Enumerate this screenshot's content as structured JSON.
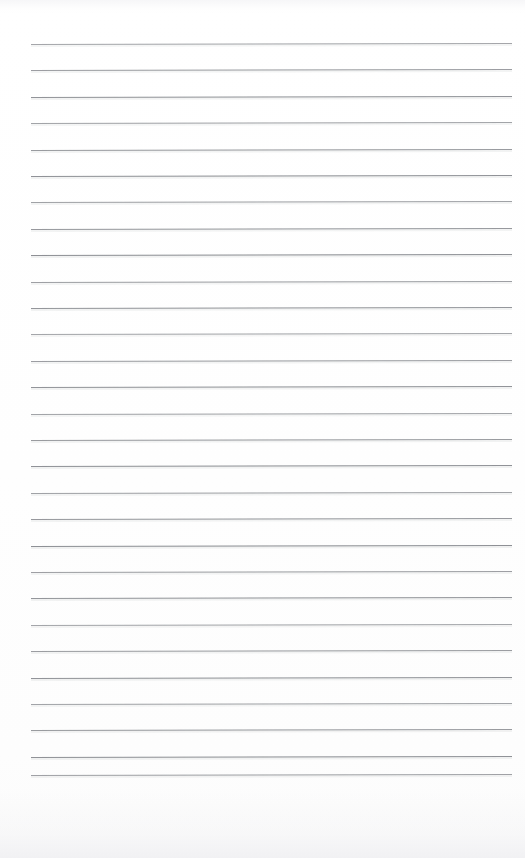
{
  "document": {
    "kind": "lined-notepad-page",
    "title": "Blank Ruled Notepad Page",
    "description": "Scanned blank sheet of ruled writing paper with horizontal ruling lines and no written content.",
    "page_width": 525,
    "page_height": 858,
    "background_color": "#ffffff",
    "rule_color": "#8b8d92",
    "content_text": "",
    "has_handwriting": false,
    "has_margin_rule": false,
    "has_holes": false,
    "has_header": false,
    "has_footer": false
  },
  "ruling": {
    "line_count": 29,
    "line_start_x": 31,
    "line_end_x": 512,
    "line_length": 481,
    "first_line_y": 44,
    "last_line_y": 775,
    "line_spacing": 26.4,
    "line_thickness": 1,
    "tilt_degrees": -0.12,
    "lines_y": [
      44,
      70.4,
      96.8,
      123.2,
      149.6,
      176,
      202.4,
      228.8,
      255.2,
      281.6,
      308,
      334.4,
      360.8,
      387.2,
      413.6,
      440,
      466.4,
      492.8,
      519.2,
      545.6,
      572,
      598.4,
      624.8,
      651.2,
      677.6,
      704,
      730.4,
      756.8,
      775
    ]
  },
  "margins": {
    "top_margin": 44,
    "left_margin": 31,
    "right_margin": 13,
    "bottom_margin": 83
  },
  "artifacts": {
    "bottom_scan_shadow": true,
    "top_scan_smudge": true,
    "noise_color": "#f3f3f5"
  }
}
